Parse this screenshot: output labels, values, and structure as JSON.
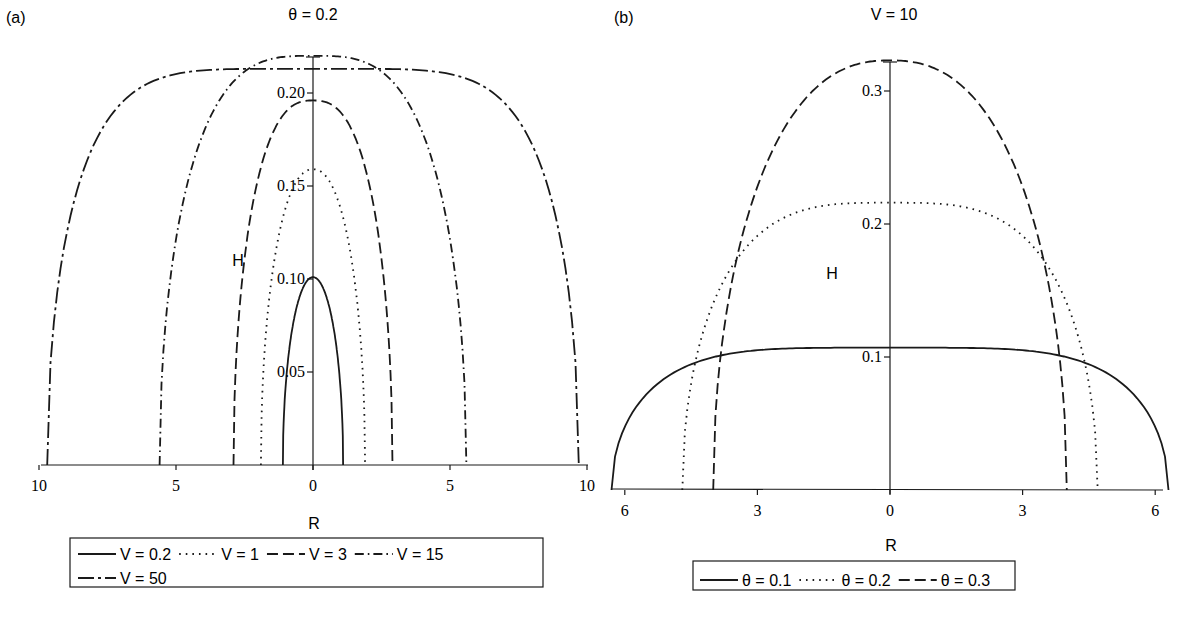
{
  "panels": {
    "a": {
      "label": "(a)",
      "title": "θ = 0.2",
      "ylabel": "H",
      "xlabel": "R",
      "xticks": [
        "10",
        "5",
        "0",
        "5",
        "10"
      ],
      "yticks": [
        "0.05",
        "0.10",
        "0.15",
        "0.20"
      ],
      "legend": [
        "V = 0.2",
        "V = 1",
        "V = 3",
        "V = 15",
        "V = 50"
      ]
    },
    "b": {
      "label": "(b)",
      "title": "V = 10",
      "ylabel": "H",
      "xlabel": "R",
      "xticks": [
        "6",
        "3",
        "0",
        "3",
        "6"
      ],
      "yticks": [
        "0.1",
        "0.2",
        "0.3"
      ],
      "legend": [
        "θ = 0.1",
        "θ = 0.2",
        "θ = 0.3"
      ]
    }
  },
  "chart_data": [
    {
      "type": "line",
      "panel": "(a)",
      "title": "θ = 0.2",
      "xlabel": "R",
      "ylabel": "H",
      "xlim": [
        -10,
        10
      ],
      "ylim": [
        0,
        0.22
      ],
      "xticks": [
        -10,
        -5,
        0,
        5,
        10
      ],
      "xtick_labels": [
        "10",
        "5",
        "0",
        "5",
        "10"
      ],
      "yticks": [
        0.05,
        0.1,
        0.15,
        0.2
      ],
      "grid": false,
      "legend_position": "bottom",
      "series": [
        {
          "name": "V = 0.2",
          "style": "solid",
          "peak_H": 0.101,
          "edge_R": 1.1,
          "shape_exp": 2.0
        },
        {
          "name": "V = 1",
          "style": "dotted",
          "peak_H": 0.159,
          "edge_R": 1.9,
          "shape_exp": 2.2
        },
        {
          "name": "V = 3",
          "style": "dashed",
          "peak_H": 0.196,
          "edge_R": 2.9,
          "shape_exp": 2.6
        },
        {
          "name": "V = 15",
          "style": "dash-dot",
          "peak_H": 0.22,
          "edge_R": 5.6,
          "shape_exp": 3.2
        },
        {
          "name": "V = 50",
          "style": "long-dash-short",
          "peak_H": 0.213,
          "edge_R": 9.7,
          "shape_exp": 5.5
        }
      ]
    },
    {
      "type": "line",
      "panel": "(b)",
      "title": "V = 10",
      "xlabel": "R",
      "ylabel": "H",
      "xlim": [
        -6.3,
        6.3
      ],
      "ylim": [
        0,
        0.33
      ],
      "xticks": [
        -6,
        -3,
        0,
        3,
        6
      ],
      "xtick_labels": [
        "6",
        "3",
        "0",
        "3",
        "6"
      ],
      "yticks": [
        0.1,
        0.2,
        0.3
      ],
      "grid": false,
      "legend_position": "bottom",
      "series": [
        {
          "name": "θ = 0.1",
          "style": "solid",
          "peak_H": 0.107,
          "edge_R": 6.3,
          "shape_exp": 4.5
        },
        {
          "name": "θ = 0.2",
          "style": "dotted",
          "peak_H": 0.216,
          "edge_R": 4.7,
          "shape_exp": 3.4
        },
        {
          "name": "θ = 0.3",
          "style": "dashed",
          "peak_H": 0.323,
          "edge_R": 4.0,
          "shape_exp": 2.4
        }
      ]
    }
  ]
}
